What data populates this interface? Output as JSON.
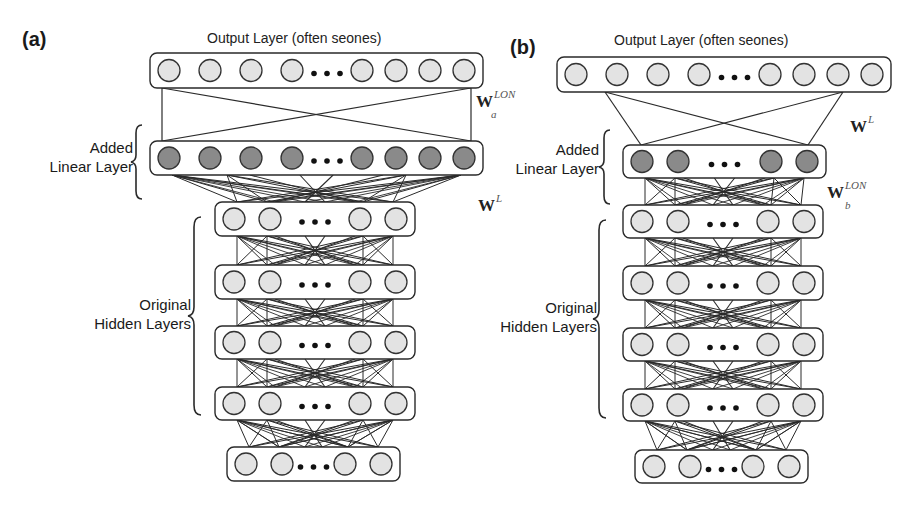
{
  "colors": {
    "line": "#2a2a2a",
    "box_fill": "#ffffff",
    "node_light": "#e3e3e3",
    "node_dark": "#8a8a8a",
    "dots": "#111111"
  },
  "panels": [
    {
      "id": "a",
      "tag": "(a)",
      "output_title": "Output Layer (often seones)",
      "added_label_line1": "Added",
      "added_label_line2": "Linear Layer",
      "hidden_label_line1": "Original",
      "hidden_label_line2": "Hidden Layers",
      "weight_top": {
        "base": "W",
        "sub": "a",
        "sup": "LON"
      },
      "weight_bottom": {
        "base": "W",
        "sup": "L"
      },
      "layers": [
        {
          "name": "output-layer",
          "x": 150,
          "y": 53,
          "w": 333,
          "h": 35,
          "nodes_left": 4,
          "nodes_right": 4,
          "shade": "light",
          "r": 11
        },
        {
          "name": "added-linear-layer",
          "x": 150,
          "y": 141,
          "w": 333,
          "h": 34,
          "nodes_left": 4,
          "nodes_right": 4,
          "shade": "dark",
          "r": 11
        },
        {
          "name": "hidden-layer-1",
          "x": 215,
          "y": 202,
          "w": 200,
          "h": 34,
          "nodes_left": 2,
          "nodes_right": 2,
          "shade": "light",
          "r": 11
        },
        {
          "name": "hidden-layer-2",
          "x": 215,
          "y": 265,
          "w": 200,
          "h": 34,
          "nodes_left": 2,
          "nodes_right": 2,
          "shade": "light",
          "r": 11
        },
        {
          "name": "hidden-layer-3",
          "x": 215,
          "y": 326,
          "w": 200,
          "h": 33,
          "nodes_left": 2,
          "nodes_right": 2,
          "shade": "light",
          "r": 11
        },
        {
          "name": "hidden-layer-4",
          "x": 215,
          "y": 387,
          "w": 200,
          "h": 33,
          "nodes_left": 2,
          "nodes_right": 2,
          "shade": "light",
          "r": 11
        },
        {
          "name": "input-layer",
          "x": 227,
          "y": 447,
          "w": 173,
          "h": 34,
          "nodes_left": 2,
          "nodes_right": 2,
          "shade": "light",
          "r": 11
        }
      ]
    },
    {
      "id": "b",
      "tag": "(b)",
      "output_title": "Output Layer (often seones)",
      "added_label_line1": "Added",
      "added_label_line2": "Linear Layer",
      "hidden_label_line1": "Original",
      "hidden_label_line2": "Hidden Layers",
      "weight_top": {
        "base": "W",
        "sup": "L"
      },
      "weight_bottom": {
        "base": "W",
        "sub": "b",
        "sup": "LON"
      },
      "layers": [
        {
          "name": "output-layer",
          "x": 557,
          "y": 57,
          "w": 334,
          "h": 35,
          "nodes_left": 4,
          "nodes_right": 4,
          "shade": "light",
          "r": 11
        },
        {
          "name": "added-linear-layer",
          "x": 623,
          "y": 145,
          "w": 203,
          "h": 33,
          "nodes_left": 2,
          "nodes_right": 2,
          "shade": "dark",
          "r": 11
        },
        {
          "name": "hidden-layer-1",
          "x": 623,
          "y": 205,
          "w": 200,
          "h": 33,
          "nodes_left": 2,
          "nodes_right": 2,
          "shade": "light",
          "r": 11
        },
        {
          "name": "hidden-layer-2",
          "x": 623,
          "y": 266,
          "w": 200,
          "h": 34,
          "nodes_left": 2,
          "nodes_right": 2,
          "shade": "light",
          "r": 11
        },
        {
          "name": "hidden-layer-3",
          "x": 623,
          "y": 328,
          "w": 200,
          "h": 33,
          "nodes_left": 2,
          "nodes_right": 2,
          "shade": "light",
          "r": 11
        },
        {
          "name": "hidden-layer-4",
          "x": 623,
          "y": 389,
          "w": 200,
          "h": 32,
          "nodes_left": 2,
          "nodes_right": 2,
          "shade": "light",
          "r": 11
        },
        {
          "name": "input-layer",
          "x": 635,
          "y": 450,
          "w": 173,
          "h": 33,
          "nodes_left": 2,
          "nodes_right": 2,
          "shade": "light",
          "r": 11
        }
      ]
    }
  ]
}
